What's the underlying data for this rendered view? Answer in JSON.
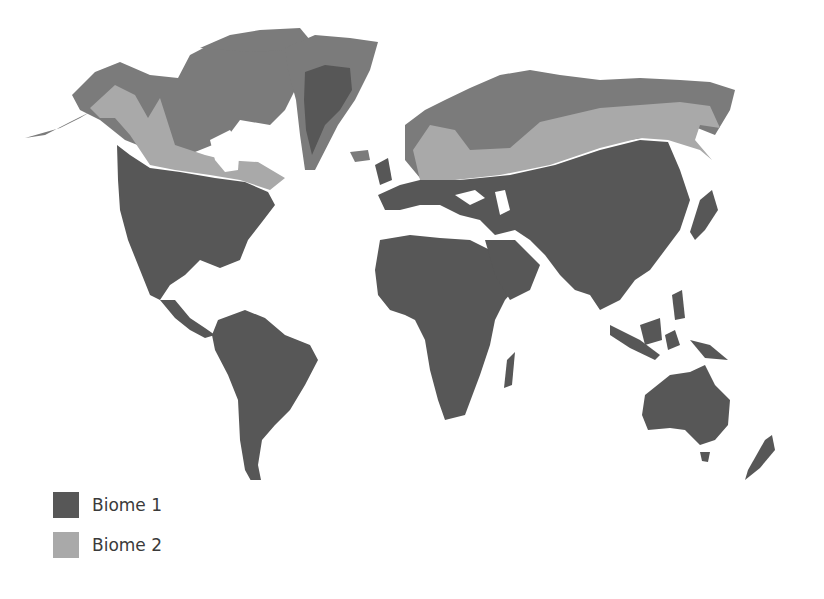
{
  "map": {
    "type": "world-biome-map",
    "colors": {
      "background": "#ffffff",
      "biome_1": "#575757",
      "biome_2": "#a9a9a9",
      "other_land": "#7b7b7b"
    },
    "regions": [
      {
        "name": "North America",
        "biome": "Biome 1 (south), Biome 2 (boreal band), other (arctic)"
      },
      {
        "name": "Greenland",
        "biome": "Biome 1 interior, other coast"
      },
      {
        "name": "Eurasia",
        "biome": "Biome 1 (south), Biome 2 (boreal band), other (arctic)"
      },
      {
        "name": "South America",
        "biome": "Biome 1"
      },
      {
        "name": "Africa",
        "biome": "Biome 1"
      },
      {
        "name": "Australia",
        "biome": "Biome 1"
      }
    ]
  },
  "legend": {
    "items": [
      {
        "label": "Biome 1",
        "color": "#575757"
      },
      {
        "label": "Biome 2",
        "color": "#a9a9a9"
      }
    ]
  }
}
